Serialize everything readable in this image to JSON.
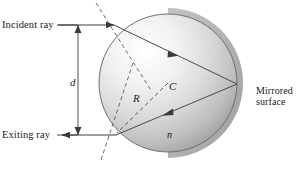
{
  "figure": {
    "type": "optics-ray-diagram",
    "width": 303,
    "height": 175,
    "background_color": "#ffffff"
  },
  "labels": {
    "incident_ray": "Incident ray",
    "exiting_ray": "Exiting ray",
    "mirrored_surface_line1": "Mirrored",
    "mirrored_surface_line2": "surface",
    "distance": "d",
    "radius": "R",
    "center": "C",
    "index": "n"
  },
  "geometry": {
    "sphere": {
      "cx": 168,
      "cy": 83,
      "r": 69
    },
    "entry_point": {
      "x": 114,
      "y": 25
    },
    "exit_point": {
      "x": 116,
      "y": 135
    },
    "mirror_point": {
      "x": 237,
      "y": 84
    },
    "center_point": {
      "x": 168,
      "y": 83
    },
    "incident_ray_y": 25,
    "exiting_ray_y": 135,
    "dimension_line_x": 78,
    "dimension_top_y": 25,
    "dimension_bottom_y": 135
  },
  "colors": {
    "stroke": "#3a3a3a",
    "sphere_light": "#fcfcfc",
    "sphere_mid": "#d6d6d6",
    "sphere_dark": "#9a9a9a",
    "mirror_band": "#a9a9a9",
    "text": "#1a1a1a"
  }
}
